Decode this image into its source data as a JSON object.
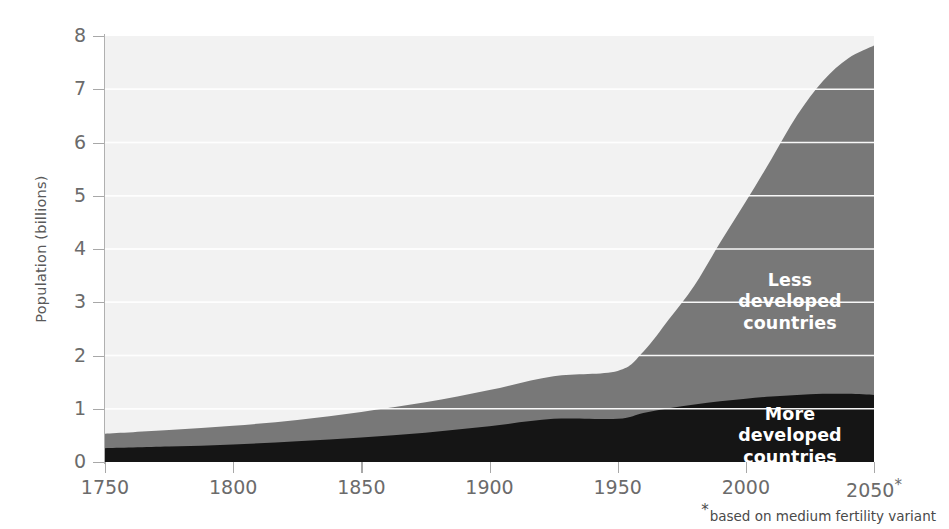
{
  "chart_data": {
    "type": "area",
    "title": "",
    "subtitle": "",
    "xlabel": "",
    "ylabel": "Population (billions)",
    "xlim": [
      1750,
      2050
    ],
    "ylim": [
      0,
      8
    ],
    "grid": true,
    "stacked": true,
    "legend_position": "in-plot-labels",
    "x_tick_labels": [
      "1750",
      "1800",
      "1850",
      "1900",
      "1950",
      "2000",
      "2050"
    ],
    "x_ticks": [
      1750,
      1800,
      1850,
      1900,
      1950,
      2000,
      2050
    ],
    "y_tick_labels": [
      "0",
      "1",
      "2",
      "3",
      "4",
      "5",
      "6",
      "7",
      "8"
    ],
    "y_ticks": [
      0,
      1,
      2,
      3,
      4,
      5,
      6,
      7,
      8
    ],
    "last_tick_suffix": "*",
    "footnote_marker": "*",
    "footnote": "based on medium fertility variant",
    "x": [
      1750,
      1775,
      1800,
      1825,
      1850,
      1875,
      1900,
      1925,
      1950,
      1960,
      1970,
      1980,
      1990,
      2000,
      2010,
      2020,
      2030,
      2040,
      2050
    ],
    "series": [
      {
        "name": "More developed countries",
        "color": "#151515",
        "values": [
          0.26,
          0.29,
          0.33,
          0.39,
          0.46,
          0.55,
          0.67,
          0.81,
          0.81,
          0.92,
          1.01,
          1.08,
          1.14,
          1.19,
          1.23,
          1.26,
          1.28,
          1.28,
          1.26
        ]
      },
      {
        "name": "Less developed countries",
        "color": "#787878",
        "values": [
          0.53,
          0.6,
          0.68,
          0.79,
          0.94,
          1.12,
          1.35,
          1.61,
          1.71,
          2.07,
          2.68,
          3.32,
          4.12,
          4.89,
          5.69,
          6.51,
          7.15,
          7.58,
          7.82
        ]
      }
    ],
    "series_order_bottom_to_top": [
      "More developed countries",
      "Less developed countries"
    ],
    "background_color": "#f2f2f2",
    "gridline_color": "#ffffff",
    "axis_color": "#a8a8a8",
    "tick_text_color": "#6b6b6b"
  },
  "axis": {
    "y_title": "Population (billions)",
    "y_ticks": [
      {
        "label": "8",
        "value": 8
      },
      {
        "label": "7",
        "value": 7
      },
      {
        "label": "6",
        "value": 6
      },
      {
        "label": "5",
        "value": 5
      },
      {
        "label": "4",
        "value": 4
      },
      {
        "label": "3",
        "value": 3
      },
      {
        "label": "2",
        "value": 2
      },
      {
        "label": "1",
        "value": 1
      },
      {
        "label": "0",
        "value": 0
      }
    ],
    "x_ticks": [
      {
        "label": "1750",
        "value": 1750,
        "suffix": ""
      },
      {
        "label": "1800",
        "value": 1800,
        "suffix": ""
      },
      {
        "label": "1850",
        "value": 1850,
        "suffix": ""
      },
      {
        "label": "1900",
        "value": 1900,
        "suffix": ""
      },
      {
        "label": "1950",
        "value": 1950,
        "suffix": ""
      },
      {
        "label": "2000",
        "value": 2000,
        "suffix": ""
      },
      {
        "label": "2050",
        "value": 2050,
        "suffix": "*"
      }
    ]
  },
  "labels": {
    "less_developed": "Less developed\ncountries",
    "more_developed": "More developed\ncountries"
  },
  "footnote": {
    "marker": "*",
    "text": "based on medium fertility variant"
  }
}
